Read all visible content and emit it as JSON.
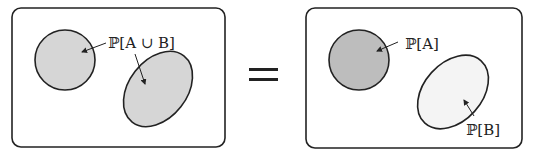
{
  "diagram": {
    "left_panel": {
      "label": "ℙ[A ∪ B]",
      "shapes": [
        {
          "name": "set-A",
          "type": "circle",
          "fill": "#d6d6d6"
        },
        {
          "name": "set-B",
          "type": "ellipse",
          "fill": "#d6d6d6"
        }
      ]
    },
    "operator": "=",
    "right_panel": {
      "label_a": "ℙ[A]",
      "label_b": "ℙ[B]",
      "shapes": [
        {
          "name": "set-A",
          "type": "circle",
          "fill": "#bdbdbd"
        },
        {
          "name": "set-B",
          "type": "ellipse",
          "fill": "#f4f4f4"
        }
      ]
    },
    "colors": {
      "stroke": "#222222",
      "left_fill": "#d6d6d6",
      "right_a_fill": "#bdbdbd",
      "right_b_fill": "#f4f4f4"
    }
  }
}
